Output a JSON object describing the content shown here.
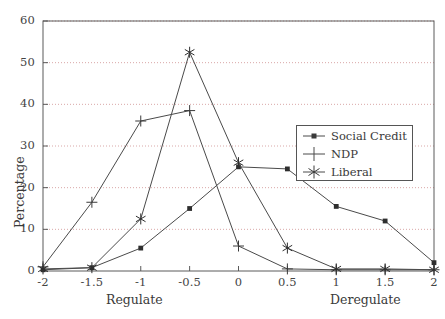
{
  "chart_data": {
    "type": "line",
    "title": "",
    "xlabel": "",
    "ylabel": "Percentage",
    "x": [
      -2,
      -1.5,
      -1,
      -0.5,
      0,
      0.5,
      1,
      1.5,
      2
    ],
    "xticklabels": [
      "-2",
      "-1.5",
      "-1",
      "-0.5",
      "0",
      "0.5",
      "1",
      "1.5",
      "2"
    ],
    "yticklabels": [
      "0",
      "10",
      "20",
      "30",
      "40",
      "50",
      "60"
    ],
    "yticks": [
      0,
      10,
      20,
      30,
      40,
      50,
      60
    ],
    "xlim": [
      -2,
      2
    ],
    "ylim": [
      0,
      60
    ],
    "grid": true,
    "grid_axis": "y",
    "legend_position": "center-right",
    "series": [
      {
        "name": "Social Credit",
        "marker": "filled-square",
        "values": [
          0.3,
          0.8,
          5.5,
          15.0,
          25.0,
          24.5,
          15.5,
          12.0,
          2.0
        ]
      },
      {
        "name": "NDP",
        "marker": "plus",
        "values": [
          1.0,
          16.5,
          36.0,
          38.5,
          6.0,
          0.5,
          0.3,
          0.3,
          0.3
        ]
      },
      {
        "name": "Liberal",
        "marker": "asterisk",
        "values": [
          0.5,
          0.8,
          12.5,
          52.5,
          26.0,
          5.5,
          0.5,
          0.5,
          0.3
        ]
      }
    ],
    "axis_endpoint_labels": {
      "left": "Regulate",
      "right": "Deregulate"
    },
    "colors": {
      "line": "#4a4a4a",
      "grid": "#d9a8a8",
      "frame": "#5a5a5a",
      "text": "#3a3a3a"
    }
  }
}
